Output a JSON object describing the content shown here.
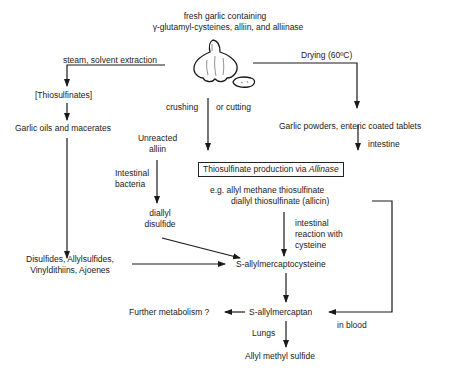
{
  "diagram": {
    "source": {
      "line1": "fresh garlic containing",
      "line2": "γ-glutamyl-cysteines, alliin, and alliinase"
    },
    "edges": {
      "steam": "steam, solvent extraction",
      "drying": "Drying (60ºC)",
      "crushing": "crushing",
      "cutting": "or cutting",
      "intestine": "intestine",
      "bacteria_line1": "Intestinal",
      "bacteria_line2": "bacteria",
      "reaction_line1": "intestinal",
      "reaction_line2": "reaction with",
      "reaction_line3": "cysteine",
      "lungs": "Lungs",
      "in_blood": "in blood"
    },
    "nodes": {
      "thiosulfinates": "[Thiosulfinates]",
      "garlic_oils": "Garlic oils and macerates",
      "powders": "Garlic powders, enteric coated tablets",
      "unreacted_line1": "Unreacted",
      "unreacted_line2": "alliin",
      "production_prefix": "Thiosulfinate production via ",
      "production_enzyme": "Allinase",
      "eg_line1": "e.g.  allyl methane thiosulfinate",
      "eg_line2": "diallyl thiosulfinate (allicin)",
      "diallyl_line1": "diallyl",
      "diallyl_line2": "disulfide",
      "disulfides_line1": "Disulfides, Allylsulfides,",
      "disulfides_line2": "Vinyldithiins, Ajoenes",
      "samc": "S-allylmercaptocysteine",
      "further": "Further metabolism ?",
      "sam": "S-allylmercaptan",
      "ams": "Allyl methyl sulfide"
    },
    "icons": {
      "garlic": "garlic-bulb-icon"
    }
  }
}
